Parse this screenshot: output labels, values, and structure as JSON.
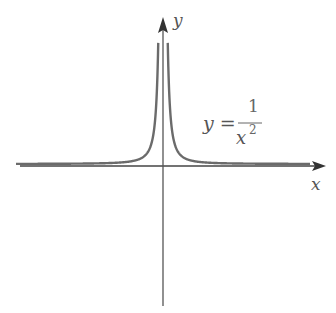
{
  "chart_data": {
    "type": "line",
    "title": "",
    "function": "y = 1/x^2",
    "xlabel": "x",
    "ylabel": "y",
    "annotation": {
      "text_lhs": "y =",
      "numerator": "1",
      "denominator": "x",
      "exponent": "2"
    },
    "grid": false,
    "legend": null,
    "series": [
      {
        "name": "y = 1/x^2",
        "color": "#6b6b6b",
        "description": "Two symmetric branches rising to vertical asymptote at x=0, approaching y=0 horizontal asymptote"
      }
    ],
    "colors": {
      "axis": "#555555",
      "curve": "#6b6b6b"
    }
  }
}
